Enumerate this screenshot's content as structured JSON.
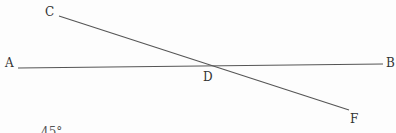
{
  "diagram": {
    "type": "geometry",
    "points": {
      "A": {
        "label": "A",
        "x": 18,
        "y": 68
      },
      "B": {
        "label": "B",
        "x": 383,
        "y": 64
      },
      "C": {
        "label": "C",
        "x": 59,
        "y": 16
      },
      "F": {
        "label": "F",
        "x": 349,
        "y": 110
      },
      "D": {
        "label": "D",
        "x": 203,
        "y": 66
      }
    },
    "lines": [
      {
        "name": "AB",
        "from": "A",
        "to": "B"
      },
      {
        "name": "CF",
        "from": "C",
        "to": "F"
      }
    ],
    "intersection": "D",
    "line_color": "#555555",
    "label_color": "#333333"
  },
  "caption": {
    "partial_text": "45°"
  },
  "top_fragments": [
    "–",
    "–"
  ]
}
